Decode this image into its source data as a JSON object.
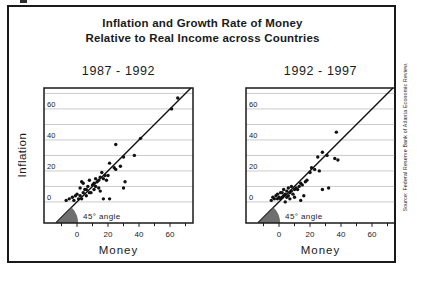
{
  "figure": {
    "title_line1": "Inflation and Growth Rate of Money",
    "title_line2": "Relative to Real Income across Countries",
    "y_axis_label": "Inflation",
    "x_axis_label": "Money",
    "angle_label": "45° angle",
    "source_note": "Source: Federal Reserve Bank of Atlanta Economic Review."
  },
  "colors": {
    "text": "#1a1a1a",
    "gridline": "#b3b3b3",
    "box_border": "#1a1a1a",
    "dot": "#111111",
    "line": "#111111",
    "wedge": "#6f6f6f",
    "background": "#ffffff"
  },
  "chart_data": [
    {
      "type": "scatter",
      "title": "1987 - 1992",
      "xlabel": "Money",
      "ylabel": "Inflation",
      "xlim": [
        -21.3,
        74.8
      ],
      "ylim": [
        -13.5,
        73.5
      ],
      "x_ticks_major": [
        0,
        20,
        40,
        60
      ],
      "x_ticks_minor": [
        -10,
        10,
        30,
        50,
        70
      ],
      "y_gridlines": [
        0,
        10,
        20,
        30,
        40,
        50,
        60,
        70
      ],
      "y_tick_labels": [
        0,
        20,
        40,
        60
      ],
      "grid": "horizontal only",
      "legend": "none",
      "reference_line": "y = x (45-degree line through origin)",
      "annotation": "45° angle wedge at intersection of 45-degree line and bottom axis",
      "points": [
        [
          -7,
          1
        ],
        [
          -5,
          2
        ],
        [
          -3,
          3
        ],
        [
          -2,
          1
        ],
        [
          -1,
          4
        ],
        [
          0,
          5
        ],
        [
          1,
          2
        ],
        [
          2,
          9
        ],
        [
          2,
          4
        ],
        [
          3,
          2
        ],
        [
          3,
          13
        ],
        [
          4,
          6
        ],
        [
          4,
          12
        ],
        [
          5,
          8
        ],
        [
          6,
          4
        ],
        [
          6,
          8
        ],
        [
          7,
          10
        ],
        [
          8,
          6
        ],
        [
          8,
          14
        ],
        [
          9,
          6
        ],
        [
          10,
          11
        ],
        [
          11,
          8
        ],
        [
          11,
          12
        ],
        [
          12,
          10
        ],
        [
          12,
          15
        ],
        [
          13,
          13
        ],
        [
          14,
          9
        ],
        [
          14,
          14
        ],
        [
          15,
          7
        ],
        [
          15,
          16
        ],
        [
          16,
          19
        ],
        [
          17,
          2
        ],
        [
          17,
          15
        ],
        [
          18,
          17
        ],
        [
          19,
          14
        ],
        [
          20,
          17
        ],
        [
          21,
          25
        ],
        [
          21,
          2
        ],
        [
          24,
          22
        ],
        [
          25,
          21
        ],
        [
          25,
          37
        ],
        [
          28,
          23
        ],
        [
          30,
          9
        ],
        [
          30,
          29
        ],
        [
          31,
          13
        ],
        [
          37,
          30
        ],
        [
          41,
          41
        ],
        [
          61,
          60
        ],
        [
          65,
          67
        ]
      ]
    },
    {
      "type": "scatter",
      "title": "1992 - 1997",
      "xlabel": "Money",
      "ylabel": "Inflation",
      "xlim": [
        -21.3,
        74.8
      ],
      "ylim": [
        -13.5,
        73.5
      ],
      "x_ticks_major": [
        0,
        20,
        40,
        60
      ],
      "x_ticks_minor": [
        -10,
        10,
        30,
        50,
        70
      ],
      "y_gridlines": [
        0,
        10,
        20,
        30,
        40,
        50,
        60,
        70
      ],
      "y_tick_labels": [
        0,
        20,
        40,
        60
      ],
      "grid": "horizontal only",
      "legend": "none",
      "reference_line": "y = x (45-degree line through origin)",
      "annotation": "45° angle wedge at intersection of 45-degree line and bottom axis",
      "points": [
        [
          -5,
          1
        ],
        [
          -4,
          3
        ],
        [
          -3,
          2
        ],
        [
          -2,
          4
        ],
        [
          -1,
          2
        ],
        [
          -1,
          5
        ],
        [
          0,
          3
        ],
        [
          1,
          2
        ],
        [
          1,
          6
        ],
        [
          2,
          3
        ],
        [
          2,
          6
        ],
        [
          3,
          4
        ],
        [
          3,
          8
        ],
        [
          4,
          0
        ],
        [
          4,
          5
        ],
        [
          5,
          3
        ],
        [
          5,
          7
        ],
        [
          6,
          4
        ],
        [
          6,
          9
        ],
        [
          7,
          2
        ],
        [
          7,
          6
        ],
        [
          8,
          7
        ],
        [
          8,
          10
        ],
        [
          9,
          5
        ],
        [
          10,
          3
        ],
        [
          10,
          8
        ],
        [
          11,
          9
        ],
        [
          12,
          8
        ],
        [
          13,
          10
        ],
        [
          14,
          1
        ],
        [
          14,
          12
        ],
        [
          15,
          11
        ],
        [
          16,
          4
        ],
        [
          17,
          13
        ],
        [
          18,
          14
        ],
        [
          20,
          19
        ],
        [
          21,
          22
        ],
        [
          23,
          21
        ],
        [
          25,
          29
        ],
        [
          26,
          20
        ],
        [
          28,
          8
        ],
        [
          28,
          32
        ],
        [
          31,
          30
        ],
        [
          32,
          9
        ],
        [
          36,
          28
        ],
        [
          38,
          27
        ],
        [
          37,
          45
        ]
      ]
    }
  ]
}
